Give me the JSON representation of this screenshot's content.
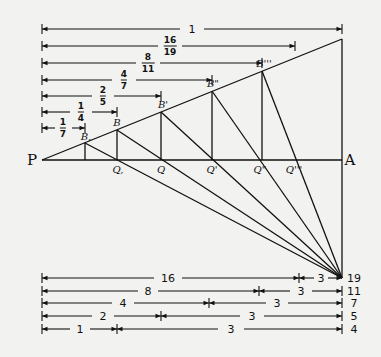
{
  "points": {
    "P": "P",
    "A": "A",
    "B1": "B,",
    "B": "B",
    "Bp": "B'",
    "Bpp": "B\"",
    "Bppp": "B'''",
    "Q1": "Q,",
    "Q": "Q",
    "Qp": "Q'",
    "Qpp": "Q\"",
    "Qppp": "Q'''"
  },
  "top_dimensions": [
    {
      "num": "1",
      "den": "",
      "label": "1"
    },
    {
      "num": "16",
      "den": "19"
    },
    {
      "num": "8",
      "den": "11"
    },
    {
      "num": "4",
      "den": "7"
    },
    {
      "num": "2",
      "den": "5"
    },
    {
      "num": "1",
      "den": "4"
    },
    {
      "num": "1",
      "den": "7"
    }
  ],
  "bottom_dimensions": [
    {
      "left": "16",
      "right": "3",
      "total": "19"
    },
    {
      "left": "8",
      "right": "3",
      "total": "11"
    },
    {
      "left": "4",
      "right": "3",
      "total": "7"
    },
    {
      "left": "2",
      "right": "3",
      "total": "5"
    },
    {
      "left": "1",
      "right": "3",
      "total": "4"
    }
  ]
}
